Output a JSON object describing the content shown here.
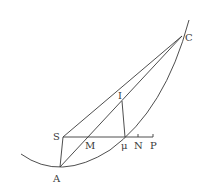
{
  "diagram": {
    "type": "geometric-construction",
    "stroke_color": "#3a3a3a",
    "background": "#ffffff",
    "points": {
      "C": {
        "label": "C",
        "x": 182,
        "y": 36,
        "lx": 185,
        "ly": 41
      },
      "S": {
        "label": "S",
        "x": 63,
        "y": 137,
        "lx": 53,
        "ly": 140
      },
      "A": {
        "label": "A",
        "x": 60,
        "y": 167,
        "lx": 53,
        "ly": 182
      },
      "M": {
        "label": "M",
        "x": 89,
        "y": 137,
        "lx": 85,
        "ly": 149
      },
      "mu": {
        "label": "μ",
        "x": 125,
        "y": 137,
        "lx": 121,
        "ly": 149
      },
      "N": {
        "label": "N",
        "x": 138,
        "y": 137,
        "lx": 134,
        "ly": 149
      },
      "P": {
        "label": "P",
        "x": 153,
        "y": 137,
        "lx": 150,
        "ly": 149
      },
      "I": {
        "label": "I",
        "x": 122,
        "y": 101,
        "lx": 118,
        "ly": 99
      }
    },
    "segments": [
      "SC",
      "AC",
      "SA",
      "SP",
      "Iμ",
      "μC"
    ],
    "curve": "parabola through A and C"
  }
}
